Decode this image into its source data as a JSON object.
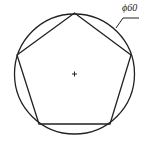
{
  "diagram": {
    "dimension_label": "ϕ60",
    "circle": {
      "cx": 74.5,
      "cy": 74,
      "r": 60
    },
    "pentagon_points": [
      [
        74.5,
        13
      ],
      [
        131,
        55
      ],
      [
        110,
        124
      ],
      [
        39,
        124
      ],
      [
        17,
        55
      ]
    ],
    "center_mark": "+",
    "stroke_color": "#222222"
  }
}
